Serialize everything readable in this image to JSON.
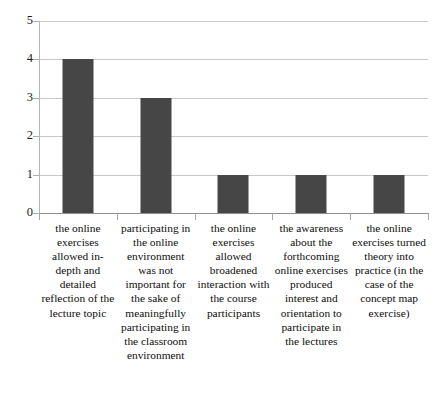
{
  "chart_data": {
    "type": "bar",
    "title": "",
    "subtitle": "",
    "xlabel": "",
    "ylabel": "",
    "ylim": [
      0,
      5
    ],
    "yticks": [
      "0",
      "1",
      "2",
      "3",
      "4",
      "5"
    ],
    "grid": true,
    "legend": false,
    "legend_position": "none",
    "bar_color": "#464646",
    "gridline_color": "#c9c9c9",
    "axis_color": "#8f8f8f",
    "background": "#ffffff",
    "categories": [
      "the online exercises allowed in-depth and detailed reflection of the lecture topic",
      "participating in the online environment was not important for the sake of meaningfully participating in the classroom environment",
      "the online exercises allowed broadened interaction with the course participants",
      "the awareness about the forthcoming online exercises produced interest and orientation to participate in the lectures",
      "the online exercises turned theory into practice (in the case of the concept map exercise)"
    ],
    "values": [
      4,
      3,
      1,
      1,
      1
    ]
  }
}
